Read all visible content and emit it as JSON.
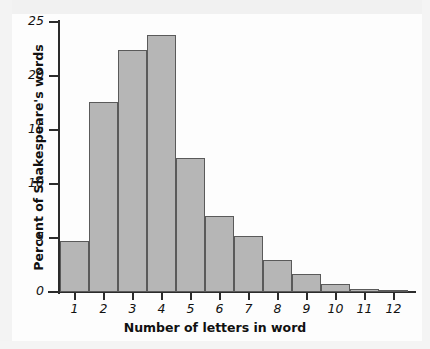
{
  "chart_data": {
    "type": "bar",
    "title": "",
    "xlabel": "Number of letters in word",
    "ylabel": "Percent of Shakespeare's words",
    "categories": [
      "1",
      "2",
      "3",
      "4",
      "5",
      "6",
      "7",
      "8",
      "9",
      "10",
      "11",
      "12"
    ],
    "values": [
      4.7,
      17.6,
      22.4,
      23.8,
      12.4,
      7.0,
      5.2,
      3.0,
      1.7,
      0.7,
      0.25,
      0.15
    ],
    "ylim": [
      0,
      25
    ],
    "yticks": [
      "0",
      "5",
      "10",
      "15",
      "20",
      "25"
    ],
    "ytick_values": [
      0,
      5,
      10,
      15,
      20,
      25
    ],
    "grid": false,
    "legend": false,
    "bar_fill_color": "#b6b6b6",
    "bar_edge_color": "#5a5a5a",
    "axis_color": "#2b2b2b"
  }
}
